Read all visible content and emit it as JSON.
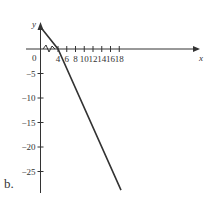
{
  "subfigure_label": "b.",
  "chart_data": {
    "type": "line",
    "title": "",
    "xlabel": "x",
    "ylabel": "y",
    "x_ticks": [
      "4",
      "6",
      "8",
      "10",
      "12",
      "14",
      "16",
      "18"
    ],
    "y_ticks": [
      "-5",
      "-10",
      "-15",
      "-20",
      "-25"
    ],
    "origin_label": "0",
    "axis_break": "x-axis break between 0 and 4",
    "series": [
      {
        "name": "line",
        "x": [
          0,
          4,
          18.4
        ],
        "y": [
          8,
          0,
          -28.8
        ]
      }
    ],
    "xlim": [
      0,
      19
    ],
    "ylim": [
      -28,
      5
    ],
    "grid": false,
    "legend": null
  }
}
